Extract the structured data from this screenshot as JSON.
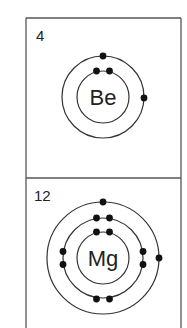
{
  "diagram": {
    "title": "",
    "line_color": "#333333",
    "electron_color": "#111111",
    "panels": [
      {
        "atomic_number": "4",
        "symbol": "Be",
        "shells": [
          2,
          2
        ],
        "center": [
          103,
          97
        ],
        "shell_radii": [
          26,
          41
        ]
      },
      {
        "atomic_number": "12",
        "symbol": "Mg",
        "shells": [
          2,
          8,
          2
        ],
        "center": [
          103,
          258
        ],
        "shell_radii": [
          26,
          40,
          56
        ]
      }
    ]
  }
}
